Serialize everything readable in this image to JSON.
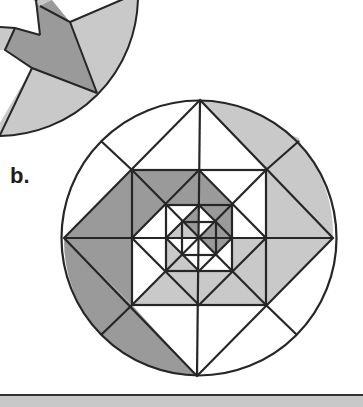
{
  "figure": {
    "label": "b.",
    "colors": {
      "stroke": "#262626",
      "light_gray": "#c9c9c9",
      "dark_gray": "#9a9a9a",
      "white": "#ffffff",
      "band": "#c8c8c8"
    }
  },
  "partial_figure": {
    "description": "fragment of previous circular figure (part a), cropped at top-left"
  }
}
